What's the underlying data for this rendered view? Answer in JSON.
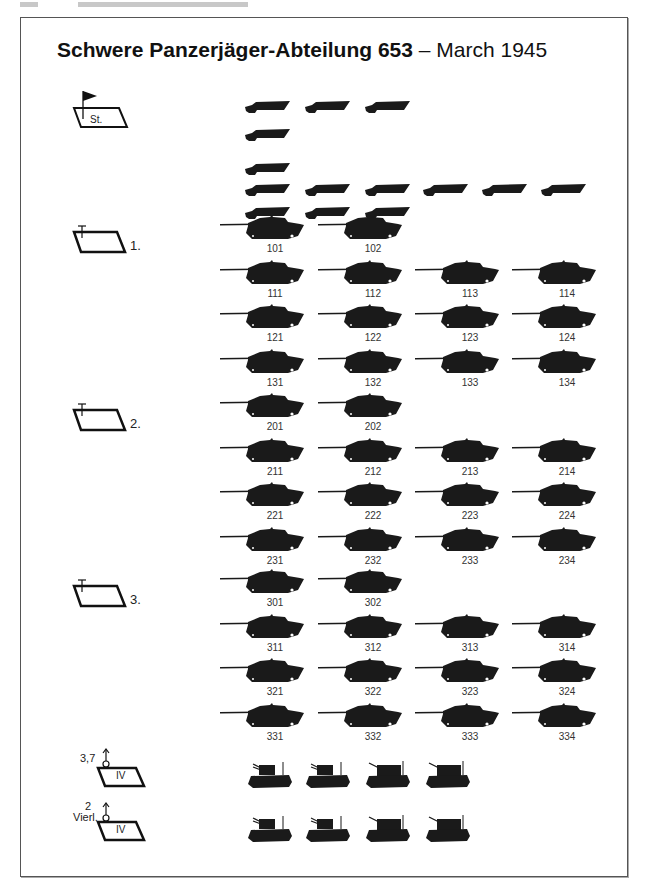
{
  "title": {
    "bold": "Schwere Panzerjäger-Abteilung 653",
    "rest": " – March 1945"
  },
  "colors": {
    "ink": "#1a1a1a",
    "frame": "#555555",
    "background": "#ffffff"
  },
  "staff": {
    "symbol_label": "St.",
    "icon": "flag-icon",
    "halftracks_rows": [
      3,
      1,
      1,
      6,
      3
    ]
  },
  "companies": [
    {
      "label": "1.",
      "rows": [
        [
          "101",
          "102"
        ],
        [
          "111",
          "112",
          "113",
          "114"
        ],
        [
          "121",
          "122",
          "123",
          "124"
        ],
        [
          "131",
          "132",
          "133",
          "134"
        ]
      ]
    },
    {
      "label": "2.",
      "rows": [
        [
          "201",
          "202"
        ],
        [
          "211",
          "212",
          "213",
          "214"
        ],
        [
          "221",
          "222",
          "223",
          "224"
        ],
        [
          "231",
          "232",
          "233",
          "234"
        ]
      ]
    },
    {
      "label": "3.",
      "rows": [
        [
          "301",
          "302"
        ],
        [
          "311",
          "312",
          "313",
          "314"
        ],
        [
          "321",
          "322",
          "323",
          "324"
        ],
        [
          "331",
          "332",
          "333",
          "334"
        ]
      ]
    }
  ],
  "flak": [
    {
      "caption": "3,7",
      "symbol_label": "IV",
      "count": 4
    },
    {
      "caption_line1": "2",
      "caption_line2": "Vierl.",
      "symbol_label": "IV",
      "count": 4
    }
  ]
}
